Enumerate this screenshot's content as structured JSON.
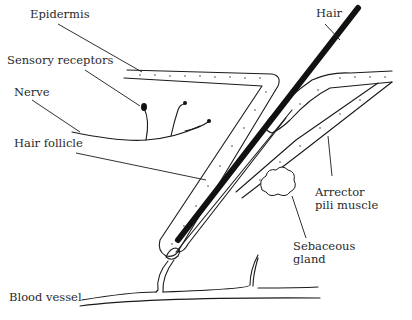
{
  "diagram": {
    "colors": {
      "line": "#1a1a1a",
      "hair": "#111111",
      "text": "#2a2a2a",
      "background": "#ffffff"
    },
    "labels": {
      "epidermis": "Epidermis",
      "sensory_receptors": "Sensory receptors",
      "nerve": "Nerve",
      "hair_follicle": "Hair follicle",
      "hair": "Hair",
      "arrector_line1": "Arrector",
      "arrector_line2": "pili muscle",
      "sebaceous_line1": "Sebaceous",
      "sebaceous_line2": "gland",
      "blood_vessel": "Blood vessel"
    }
  }
}
